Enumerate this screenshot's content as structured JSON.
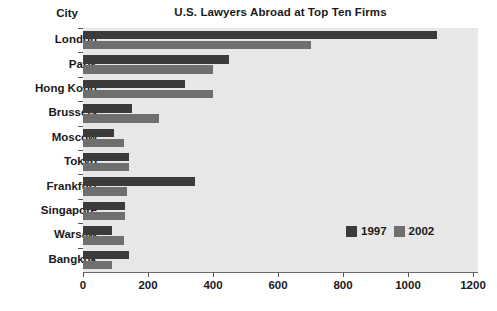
{
  "chart_data": {
    "type": "bar",
    "orientation": "horizontal",
    "title": "U.S. Lawyers Abroad at Top Ten Firms",
    "xlabel": "",
    "ylabel": "City",
    "categories": [
      "London",
      "Paris",
      "Hong Kong",
      "Brussels",
      "Moscow",
      "Tokyo",
      "Frankfurt",
      "Singapore",
      "Warsaw",
      "Bangkok"
    ],
    "series": [
      {
        "name": "1997",
        "color": "#3b3b3b",
        "values": [
          1090,
          450,
          315,
          150,
          95,
          140,
          345,
          130,
          90,
          140
        ]
      },
      {
        "name": "2002",
        "color": "#6f6f6f",
        "values": [
          700,
          400,
          400,
          235,
          125,
          140,
          135,
          130,
          125,
          90
        ]
      }
    ],
    "xlim": [
      0,
      1200
    ],
    "xticks": [
      0,
      200,
      400,
      600,
      800,
      1000,
      1200
    ],
    "xtick_labels": [
      "0",
      "200",
      "400",
      "600",
      "800",
      "1000",
      "1200"
    ],
    "grid": false,
    "legend_position": "inside-lower-right",
    "plot_background": "#e7e7e7",
    "figure_background": "#ffffff"
  }
}
